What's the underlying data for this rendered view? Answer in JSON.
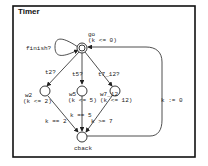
{
  "title": "Timer",
  "locations": [
    {
      "id": "go",
      "name": "go",
      "invariant": "(k <= 0)",
      "initial": true
    },
    {
      "id": "w2",
      "name": "w2",
      "invariant": "(k <= 2)"
    },
    {
      "id": "w5",
      "name": "w5",
      "invariant": "(k <= 5)"
    },
    {
      "id": "w7_12",
      "name": "w7_12",
      "invariant": "(k <= 12)"
    },
    {
      "id": "cback",
      "name": "cback",
      "invariant": ""
    }
  ],
  "edges": [
    {
      "from": "go",
      "to": "go",
      "label": "finish?"
    },
    {
      "from": "go",
      "to": "w2",
      "label": "t2?"
    },
    {
      "from": "go",
      "to": "w5",
      "label": "t5?"
    },
    {
      "from": "go",
      "to": "w7_12",
      "label": "t7_12?"
    },
    {
      "from": "w2",
      "to": "cback",
      "label": "k == 2"
    },
    {
      "from": "w5",
      "to": "cback",
      "label": "k == 5"
    },
    {
      "from": "w7_12",
      "to": "cback",
      "label": "k >= 7"
    },
    {
      "from": "cback",
      "to": "go",
      "label": "k := 0"
    }
  ]
}
